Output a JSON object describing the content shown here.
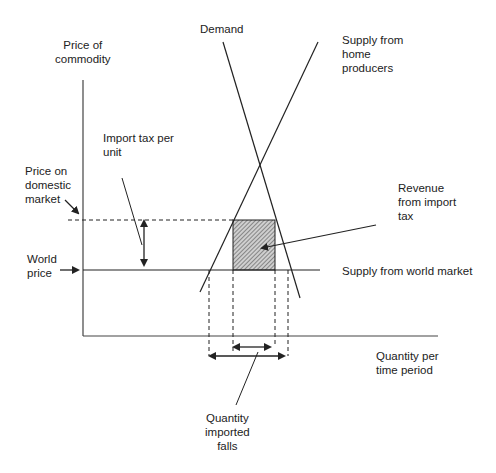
{
  "diagram": {
    "axes": {
      "y_label_line1": "Price of",
      "y_label_line2": "commodity",
      "x_label_line1": "Quantity per",
      "x_label_line2": "time period"
    },
    "curves": {
      "demand": "Demand",
      "home_supply_line1": "Supply from",
      "home_supply_line2": "home",
      "home_supply_line3": "producers",
      "world_supply": "Supply from world market"
    },
    "annotations": {
      "tax_line1": "Import tax per",
      "tax_line2": "unit",
      "domestic_line1": "Price on",
      "domestic_line2": "domestic",
      "domestic_line3": "market",
      "world_line1": "World",
      "world_line2": "price",
      "revenue_line1": "Revenue",
      "revenue_line2": "from import",
      "revenue_line3": "tax",
      "qty_line1": "Quantity",
      "qty_line2": "imported",
      "qty_line3": "falls"
    },
    "colors": {
      "line": "#222222",
      "hatch": "#555555"
    }
  }
}
